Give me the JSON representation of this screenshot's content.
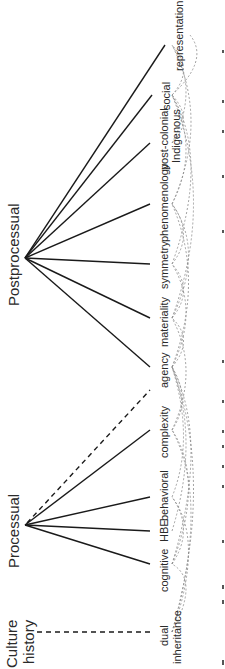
{
  "diagram": {
    "hubs": [
      {
        "id": "postprocessual",
        "label": "Postprocessual"
      },
      {
        "id": "processual",
        "label": "Processual"
      },
      {
        "id": "culture_history",
        "label_line1": "Culture",
        "label_line2": "history"
      }
    ],
    "leaves": [
      {
        "id": "representation",
        "label": "representation"
      },
      {
        "id": "social",
        "label": "social"
      },
      {
        "id": "postcolonial",
        "label_line1": "post-colonial",
        "label_line2": "Indigenous"
      },
      {
        "id": "phenomenology",
        "label": "phenomenology"
      },
      {
        "id": "symmetry",
        "label": "symmetry"
      },
      {
        "id": "materiality",
        "label": "materiality"
      },
      {
        "id": "agency",
        "label": "agency"
      },
      {
        "id": "complexity",
        "label": "complexity"
      },
      {
        "id": "behavioral",
        "label": "behavioral"
      },
      {
        "id": "hbe",
        "label": "HBE"
      },
      {
        "id": "cognitive",
        "label": "cognitive"
      },
      {
        "id": "dual_inheritance",
        "label_line1": "dual",
        "label_line2": "inheritance"
      }
    ],
    "edges_solid": [
      [
        "postprocessual",
        "representation"
      ],
      [
        "postprocessual",
        "social"
      ],
      [
        "postprocessual",
        "postcolonial"
      ],
      [
        "postprocessual",
        "phenomenology"
      ],
      [
        "postprocessual",
        "symmetry"
      ],
      [
        "postprocessual",
        "materiality"
      ],
      [
        "postprocessual",
        "agency"
      ],
      [
        "processual",
        "complexity"
      ],
      [
        "processual",
        "behavioral"
      ],
      [
        "processual",
        "hbe"
      ],
      [
        "processual",
        "cognitive"
      ]
    ],
    "edges_dashed": [
      [
        "processual",
        "agency"
      ],
      [
        "culture_history",
        "dual_inheritance"
      ]
    ],
    "orientation": "rotated 90° counter-clockwise"
  }
}
